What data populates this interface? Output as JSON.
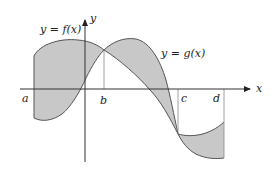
{
  "figure": {
    "type": "area-between-curves",
    "curves": [
      {
        "name": "f",
        "label": "y = f(x)"
      },
      {
        "name": "g",
        "label": "y = g(x)"
      }
    ],
    "axes": {
      "x_label": "x",
      "y_label": "y"
    },
    "points": [
      {
        "name": "a",
        "label": "a"
      },
      {
        "name": "b",
        "label": "b"
      },
      {
        "name": "c",
        "label": "c"
      },
      {
        "name": "d",
        "label": "d"
      }
    ],
    "colors": {
      "shade": "#c8c8c8",
      "curve": "#555555",
      "axis": "#333333",
      "guide": "#888888",
      "background": "#ffffff"
    }
  }
}
